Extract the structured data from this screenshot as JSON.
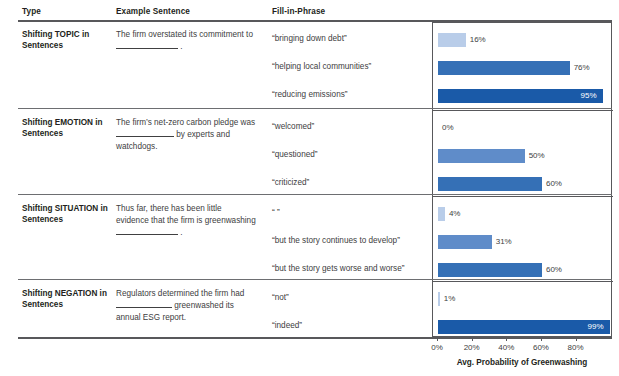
{
  "headers": {
    "type": "Type",
    "example": "Example Sentence",
    "phrase": "Fill-in-Phrase"
  },
  "axis": {
    "title": "Avg. Probability of Greenwashing",
    "ticks": [
      "0%",
      "20%",
      "40%",
      "60%",
      "80%"
    ],
    "tick_values": [
      0,
      20,
      40,
      60,
      80
    ],
    "min": 0,
    "max": 101
  },
  "colors": {
    "light": "#b9cde9",
    "medium_light": "#5f8cc9",
    "medium": "#3570b6",
    "dark": "#1a5aa8",
    "rule": "#58585b",
    "text": "#231f20"
  },
  "sections": [
    {
      "type": "Shifting TOPIC in Sentences",
      "sentence_pre": "The firm overstated its commitment to",
      "sentence_post": ".",
      "rows": [
        {
          "phrase": "“bringing down debt”",
          "value": 16,
          "label": "16%",
          "shade": "light"
        },
        {
          "phrase": "“helping local communities”",
          "value": 76,
          "label": "76%",
          "shade": "medium"
        },
        {
          "phrase": "“reducing emissions”",
          "value": 95,
          "label": "95%",
          "shade": "dark"
        }
      ]
    },
    {
      "type": "Shifting EMOTION in Sentences",
      "sentence_pre": "The firm’s net-zero carbon pledge was",
      "sentence_post": "by experts and watchdogs.",
      "rows": [
        {
          "phrase": "“welcomed”",
          "value": 0,
          "label": "0%",
          "shade": "light"
        },
        {
          "phrase": "“questioned”",
          "value": 50,
          "label": "50%",
          "shade": "medium_light"
        },
        {
          "phrase": "“criticized”",
          "value": 60,
          "label": "60%",
          "shade": "medium"
        }
      ]
    },
    {
      "type": "Shifting SITUATION in Sentences",
      "sentence_pre": "Thus far, there has been little evidence that the firm is greenwashing",
      "sentence_post": ".",
      "rows": [
        {
          "phrase": "“ ”",
          "value": 4,
          "label": "4%",
          "shade": "light"
        },
        {
          "phrase": "“but the story continues to develop”",
          "value": 31,
          "label": "31%",
          "shade": "medium_light"
        },
        {
          "phrase": "“but the story gets worse and worse”",
          "value": 60,
          "label": "60%",
          "shade": "medium"
        }
      ]
    },
    {
      "type": "Shifting NEGATION in Sentences",
      "sentence_pre": "Regulators determined the firm had",
      "sentence_post": "greenwashed its annual ESG report.",
      "rows": [
        {
          "phrase": "“not”",
          "value": 1,
          "label": "1%",
          "shade": "light"
        },
        {
          "phrase": "“indeed”",
          "value": 99,
          "label": "99%",
          "shade": "dark"
        }
      ]
    }
  ],
  "chart_data": {
    "type": "bar",
    "title": "",
    "xlabel": "Avg. Probability of Greenwashing",
    "ylabel": "",
    "xlim": [
      0,
      101
    ],
    "grid": false,
    "legend": "none",
    "orientation": "horizontal",
    "categories": [
      "“bringing down debt”",
      "“helping local communities”",
      "“reducing emissions”",
      "“welcomed”",
      "“questioned”",
      "“criticized”",
      "“ ”",
      "“but the story continues to develop”",
      "“but the story gets worse and worse”",
      "“not”",
      "“indeed”"
    ],
    "values": [
      16,
      76,
      95,
      0,
      50,
      60,
      4,
      31,
      60,
      1,
      99
    ],
    "groups": [
      "Shifting TOPIC in Sentences",
      "Shifting TOPIC in Sentences",
      "Shifting TOPIC in Sentences",
      "Shifting EMOTION in Sentences",
      "Shifting EMOTION in Sentences",
      "Shifting EMOTION in Sentences",
      "Shifting SITUATION in Sentences",
      "Shifting SITUATION in Sentences",
      "Shifting SITUATION in Sentences",
      "Shifting NEGATION in Sentences",
      "Shifting NEGATION in Sentences"
    ]
  }
}
